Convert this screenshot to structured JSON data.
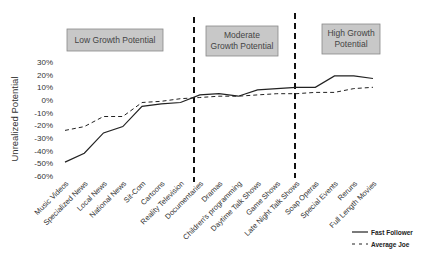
{
  "chart_data": {
    "type": "line",
    "title": "",
    "xlabel": "",
    "ylabel": "Unrealized Potential",
    "ylim": [
      -0.6,
      0.3
    ],
    "yticks": [
      "30%",
      "20%",
      "10%",
      "0%",
      "-10%",
      "-20%",
      "-30%",
      "-40%",
      "-50%",
      "-60%"
    ],
    "grid": false,
    "legend_position": "bottom-right",
    "categories": [
      "Music Videos",
      "Specialized News",
      "Local News",
      "National News",
      "Sit-Com",
      "Cartoons",
      "Reality Television",
      "Documentaries",
      "Dramas",
      "Children's programming",
      "Daytime Talk Shows",
      "Game Shows",
      "Late Night Talk Shows",
      "Soap Operas",
      "Special Events",
      "Reruns",
      "Full Length Movies"
    ],
    "series": [
      {
        "name": "Fast Follower",
        "style": "solid",
        "values": [
          -0.49,
          -0.42,
          -0.26,
          -0.21,
          -0.05,
          -0.03,
          -0.02,
          0.04,
          0.05,
          0.03,
          0.08,
          0.09,
          0.1,
          0.1,
          0.19,
          0.19,
          0.17
        ]
      },
      {
        "name": "Average Joe",
        "style": "dashed",
        "values": [
          -0.24,
          -0.21,
          -0.13,
          -0.13,
          -0.02,
          -0.01,
          0.01,
          0.02,
          0.03,
          0.03,
          0.04,
          0.05,
          0.05,
          0.06,
          0.06,
          0.09,
          0.1
        ]
      }
    ],
    "regions": [
      {
        "label": "Low Growth Potential",
        "from": "Music Videos",
        "to": "Reality Television"
      },
      {
        "label": "Moderate Growth Potential",
        "from": "Documentaries",
        "to": "Game Shows"
      },
      {
        "label": "High Growth Potential",
        "from": "Late Night Talk Shows",
        "to": "Full Length Movies"
      }
    ],
    "annotations": [
      "vertical dashed divider between Reality Television and Documentaries",
      "vertical dashed divider between Game Shows and Late Night Talk Shows"
    ]
  },
  "labels": {
    "ylabel": "Unrealized Potential",
    "region_low": "Low Growth Potential",
    "region_mod_1": "Moderate",
    "region_mod_2": "Growth Potential",
    "region_high_1": "High Growth",
    "region_high_2": "Potential",
    "legend_fast": "Fast Follower",
    "legend_avg": "Average Joe"
  }
}
